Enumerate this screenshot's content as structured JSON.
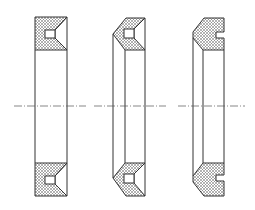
{
  "figure": {
    "views": [
      {
        "id": "seal-profile-1",
        "label": "Rectangular profile with V-notch"
      },
      {
        "id": "seal-profile-2",
        "label": "Beveled profile with V-notch"
      },
      {
        "id": "seal-profile-3",
        "label": "Chamfered profile with rectangular notch"
      }
    ],
    "colors": {
      "line": "#333333",
      "hatch": "#555555",
      "background": "#ffffff"
    }
  }
}
